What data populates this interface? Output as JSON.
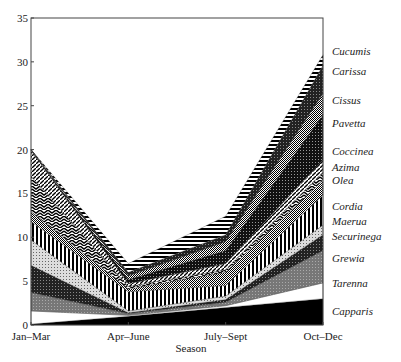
{
  "chart_data": {
    "type": "area",
    "stacked": true,
    "title": "",
    "xlabel": "Season",
    "ylabel": "",
    "ylim": [
      0,
      35
    ],
    "yticks": [
      0,
      5,
      10,
      15,
      20,
      25,
      30,
      35
    ],
    "categories": [
      "Jan–Mar",
      "Apr–June",
      "July–Sept",
      "Oct–Dec"
    ],
    "grid": false,
    "legend_position": "right (labels at series end)",
    "series": [
      {
        "name": "Capparis",
        "values": [
          0.1,
          1.0,
          2.0,
          3.0
        ]
      },
      {
        "name": "Tarenna",
        "values": [
          1.5,
          0.1,
          0.2,
          1.8
        ]
      },
      {
        "name": "Grewia",
        "values": [
          2.1,
          0.2,
          0.4,
          3.7
        ]
      },
      {
        "name": "Securinega",
        "values": [
          3.1,
          0.1,
          0.3,
          1.8
        ]
      },
      {
        "name": "Maerua",
        "values": [
          2.9,
          0.2,
          0.4,
          1.1
        ]
      },
      {
        "name": "Cordia",
        "values": [
          2.1,
          2.2,
          1.2,
          3.4
        ]
      },
      {
        "name": "Olea",
        "values": [
          1.1,
          0.3,
          1.5,
          1.7
        ]
      },
      {
        "name": "Azima",
        "values": [
          4.1,
          0.3,
          0.3,
          0.9
        ]
      },
      {
        "name": "Coccinea",
        "values": [
          2.9,
          0.3,
          0.7,
          1.4
        ]
      },
      {
        "name": "Pavetta",
        "values": [
          0.1,
          0.5,
          1.5,
          5.2
        ]
      },
      {
        "name": "Cissus",
        "values": [
          0.0,
          0.4,
          1.0,
          2.4
        ]
      },
      {
        "name": "Carissa",
        "values": [
          0.0,
          0.4,
          0.8,
          3.2
        ]
      },
      {
        "name": "Cucumis",
        "values": [
          0.0,
          1.0,
          2.1,
          1.2
        ]
      }
    ]
  },
  "axes": {
    "x_title": "Season",
    "x_ticks": [
      "Jan–Mar",
      "Apr–June",
      "July–Sept",
      "Oct–Dec"
    ],
    "y_ticks": [
      "0",
      "5",
      "10",
      "15",
      "20",
      "25",
      "30",
      "35"
    ]
  },
  "legend": [
    {
      "label": "Cucumis",
      "y": 31.2
    },
    {
      "label": "Carissa",
      "y": 29.0
    },
    {
      "label": "Cissus",
      "y": 25.7
    },
    {
      "label": "Pavetta",
      "y": 23.0
    },
    {
      "label": "Coccinea",
      "y": 19.8
    },
    {
      "label": "Azima",
      "y": 18.0
    },
    {
      "label": "Olea",
      "y": 16.5
    },
    {
      "label": "Cordia",
      "y": 13.6
    },
    {
      "label": "Maerua",
      "y": 11.9
    },
    {
      "label": "Securinega",
      "y": 10.2
    },
    {
      "label": "Grewia",
      "y": 7.6
    },
    {
      "label": "Tarenna",
      "y": 4.8
    },
    {
      "label": "Capparis",
      "y": 1.6
    }
  ]
}
